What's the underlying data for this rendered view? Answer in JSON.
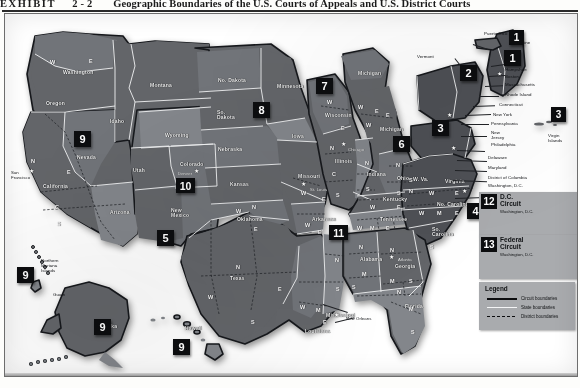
{
  "exhibit": {
    "label": "EXHIBIT",
    "number": "2-2",
    "title": "Geographic Boundaries of the U.S. Courts of Appeals and U.S. District Courts"
  },
  "legend": {
    "title": "Legend",
    "rows": [
      {
        "key": "circuit",
        "label": "Circuit boundaries",
        "color": "#0c0d0f"
      },
      {
        "key": "state",
        "label": "State boundaries",
        "color": "#f4f5f6"
      },
      {
        "key": "district",
        "label": "District boundaries",
        "color": "#0c0d0f"
      }
    ]
  },
  "court_boxes": [
    {
      "number": "12",
      "name": "D.C. Circuit",
      "city": "Washington, D.C."
    },
    {
      "number": "13",
      "name": "Federal Circuit",
      "city": "Washington, D.C."
    }
  ],
  "circuit_badges": [
    {
      "number": "1",
      "at": "puerto-rico"
    },
    {
      "number": "1",
      "at": "maine-new-england"
    },
    {
      "number": "2",
      "at": "new-york"
    },
    {
      "number": "3",
      "at": "pennsylvania-new-jersey"
    },
    {
      "number": "3",
      "at": "virgin-islands"
    },
    {
      "number": "4",
      "at": "south-carolina-virginia"
    },
    {
      "number": "5",
      "at": "texas-louisiana"
    },
    {
      "number": "6",
      "at": "ohio-michigan"
    },
    {
      "number": "7",
      "at": "wisconsin-illinois"
    },
    {
      "number": "8",
      "at": "south-dakota-plains"
    },
    {
      "number": "9",
      "at": "nevada-west"
    },
    {
      "number": "9",
      "at": "northern-mariana-guam"
    },
    {
      "number": "9",
      "at": "alaska"
    },
    {
      "number": "9",
      "at": "hawaii"
    },
    {
      "number": "10",
      "at": "colorado-mountain"
    },
    {
      "number": "11",
      "at": "alabama-georgia-florida"
    }
  ],
  "states": [
    {
      "name": "Washington",
      "x": 58,
      "y": 56
    },
    {
      "name": "Oregon",
      "x": 41,
      "y": 87
    },
    {
      "name": "Idaho",
      "x": 105,
      "y": 105
    },
    {
      "name": "Montana",
      "x": 145,
      "y": 69
    },
    {
      "name": "Wyoming",
      "x": 160,
      "y": 119
    },
    {
      "name": "Nevada",
      "x": 72,
      "y": 141
    },
    {
      "name": "Utah",
      "x": 128,
      "y": 154
    },
    {
      "name": "Colorado",
      "x": 175,
      "y": 148
    },
    {
      "name": "California",
      "x": 38,
      "y": 170
    },
    {
      "name": "Arizona",
      "x": 105,
      "y": 196
    },
    {
      "name": "New\nMexico",
      "x": 166,
      "y": 194
    },
    {
      "name": "No. Dakota",
      "x": 213,
      "y": 64
    },
    {
      "name": "So.\nDakota",
      "x": 212,
      "y": 96
    },
    {
      "name": "Nebraska",
      "x": 213,
      "y": 133
    },
    {
      "name": "Kansas",
      "x": 225,
      "y": 168
    },
    {
      "name": "Oklahoma",
      "x": 232,
      "y": 203
    },
    {
      "name": "Texas",
      "x": 225,
      "y": 262
    },
    {
      "name": "Minnesota",
      "x": 272,
      "y": 70
    },
    {
      "name": "Iowa",
      "x": 287,
      "y": 120
    },
    {
      "name": "Missouri",
      "x": 293,
      "y": 160
    },
    {
      "name": "Arkansas",
      "x": 307,
      "y": 203
    },
    {
      "name": "Louisiana",
      "x": 300,
      "y": 315
    },
    {
      "name": "Mississippi",
      "x": 321,
      "y": 299
    },
    {
      "name": "Wisconsin",
      "x": 320,
      "y": 99
    },
    {
      "name": "Illinois",
      "x": 330,
      "y": 145
    },
    {
      "name": "Indiana",
      "x": 362,
      "y": 158
    },
    {
      "name": "Michigan",
      "x": 353,
      "y": 57
    },
    {
      "name": "Michigan",
      "x": 375,
      "y": 113
    },
    {
      "name": "Ohio",
      "x": 392,
      "y": 162
    },
    {
      "name": "Kentucky",
      "x": 378,
      "y": 183
    },
    {
      "name": "Tennessee",
      "x": 375,
      "y": 203
    },
    {
      "name": "W. Va.",
      "x": 408,
      "y": 163
    },
    {
      "name": "Virginia",
      "x": 440,
      "y": 165
    },
    {
      "name": "No. Carolina",
      "x": 432,
      "y": 188
    },
    {
      "name": "So.\nCarolina",
      "x": 427,
      "y": 213
    },
    {
      "name": "Alabama",
      "x": 355,
      "y": 243
    },
    {
      "name": "Georgia",
      "x": 390,
      "y": 250
    },
    {
      "name": "Florida",
      "x": 400,
      "y": 290
    },
    {
      "name": "Alaska",
      "x": 95,
      "y": 310
    },
    {
      "name": "Hawaii",
      "x": 180,
      "y": 312
    }
  ],
  "territories": [
    {
      "name": "Puerto Rico",
      "x": 479,
      "y": 17
    },
    {
      "name": "Virgin\nIslands",
      "x": 543,
      "y": 119
    },
    {
      "name": "Northern\nMariana\nIslands",
      "x": 36,
      "y": 244
    },
    {
      "name": "Guam",
      "x": 48,
      "y": 278
    }
  ],
  "east_coast_callouts": [
    "Maine",
    "Vermont",
    "New\nHampshire",
    "Boston",
    "Massachusetts",
    "Rhode Island",
    "Connecticut",
    "New York",
    "Pennsylvania",
    "New\nJersey",
    "Philadelphia",
    "Delaware",
    "Maryland",
    "District of Columbia",
    "Washington, D.C.",
    "Richmond"
  ],
  "cities": [
    {
      "name": "San\nFrancisco",
      "x": 6,
      "y": 156
    },
    {
      "name": "Denver",
      "x": 173,
      "y": 157
    },
    {
      "name": "St. Louis",
      "x": 305,
      "y": 173
    },
    {
      "name": "New Orleans",
      "x": 341,
      "y": 302
    },
    {
      "name": "Atlanta",
      "x": 393,
      "y": 243
    },
    {
      "name": "Chicago",
      "x": 343,
      "y": 133
    }
  ],
  "district_letters": [
    {
      "l": "W",
      "x": 45,
      "y": 45
    },
    {
      "l": "E",
      "x": 84,
      "y": 44
    },
    {
      "l": "N",
      "x": 26,
      "y": 144
    },
    {
      "l": "E",
      "x": 62,
      "y": 155
    },
    {
      "l": "C",
      "x": 50,
      "y": 190
    },
    {
      "l": "S",
      "x": 52,
      "y": 207
    },
    {
      "l": "W",
      "x": 322,
      "y": 85
    },
    {
      "l": "E",
      "x": 336,
      "y": 111
    },
    {
      "l": "W",
      "x": 353,
      "y": 90
    },
    {
      "l": "E",
      "x": 370,
      "y": 94
    },
    {
      "l": "W",
      "x": 361,
      "y": 108
    },
    {
      "l": "E",
      "x": 381,
      "y": 98
    },
    {
      "l": "N",
      "x": 325,
      "y": 131
    },
    {
      "l": "C",
      "x": 327,
      "y": 157
    },
    {
      "l": "S",
      "x": 331,
      "y": 178
    },
    {
      "l": "N",
      "x": 360,
      "y": 146
    },
    {
      "l": "S",
      "x": 361,
      "y": 172
    },
    {
      "l": "N",
      "x": 391,
      "y": 148
    },
    {
      "l": "S",
      "x": 392,
      "y": 176
    },
    {
      "l": "W",
      "x": 365,
      "y": 190
    },
    {
      "l": "E",
      "x": 392,
      "y": 190
    },
    {
      "l": "W",
      "x": 352,
      "y": 211
    },
    {
      "l": "M",
      "x": 365,
      "y": 211
    },
    {
      "l": "E",
      "x": 381,
      "y": 211
    },
    {
      "l": "N",
      "x": 404,
      "y": 174
    },
    {
      "l": "S",
      "x": 404,
      "y": 163
    },
    {
      "l": "W",
      "x": 424,
      "y": 176
    },
    {
      "l": "E",
      "x": 450,
      "y": 176
    },
    {
      "l": "W",
      "x": 414,
      "y": 196
    },
    {
      "l": "M",
      "x": 432,
      "y": 196
    },
    {
      "l": "E",
      "x": 450,
      "y": 196
    },
    {
      "l": "N",
      "x": 354,
      "y": 230
    },
    {
      "l": "M",
      "x": 357,
      "y": 257
    },
    {
      "l": "S",
      "x": 347,
      "y": 270
    },
    {
      "l": "N",
      "x": 385,
      "y": 233
    },
    {
      "l": "M",
      "x": 385,
      "y": 264
    },
    {
      "l": "S",
      "x": 404,
      "y": 264
    },
    {
      "l": "N",
      "x": 392,
      "y": 275
    },
    {
      "l": "M",
      "x": 404,
      "y": 292
    },
    {
      "l": "S",
      "x": 406,
      "y": 315
    },
    {
      "l": "N",
      "x": 330,
      "y": 243
    },
    {
      "l": "S",
      "x": 331,
      "y": 272
    },
    {
      "l": "W",
      "x": 296,
      "y": 176
    },
    {
      "l": "E",
      "x": 317,
      "y": 182
    },
    {
      "l": "W",
      "x": 300,
      "y": 208
    },
    {
      "l": "E",
      "x": 313,
      "y": 215
    },
    {
      "l": "W",
      "x": 231,
      "y": 194
    },
    {
      "l": "N",
      "x": 247,
      "y": 190
    },
    {
      "l": "E",
      "x": 249,
      "y": 212
    },
    {
      "l": "N",
      "x": 231,
      "y": 250
    },
    {
      "l": "W",
      "x": 203,
      "y": 280
    },
    {
      "l": "E",
      "x": 273,
      "y": 272
    },
    {
      "l": "S",
      "x": 246,
      "y": 305
    },
    {
      "l": "W",
      "x": 295,
      "y": 290
    },
    {
      "l": "M",
      "x": 311,
      "y": 293
    },
    {
      "l": "E",
      "x": 318,
      "y": 305
    },
    {
      "l": "S",
      "x": 425,
      "y": 230
    }
  ],
  "colors": {
    "badge_bg": "#0c0d0f",
    "badge_fg": "#ffffff",
    "panel_bg": "#a9abae",
    "circuit_line": "#0c0d0f",
    "state_line": "#f4f5f6",
    "land_dark": "#4e5055",
    "land_mid": "#636569",
    "land_light": "#83868b",
    "page_bg": "#ffffff"
  }
}
